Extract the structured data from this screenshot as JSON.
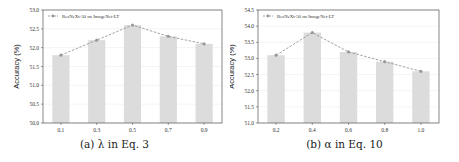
{
  "chart_data": [
    {
      "type": "bar",
      "title": "",
      "caption": "(a) λ in Eq. 3",
      "xlabel": "",
      "ylabel": "Accuracy (%)",
      "categories": [
        "0.1",
        "0.3",
        "0.5",
        "0.7",
        "0.9"
      ],
      "values": [
        51.8,
        52.2,
        52.6,
        52.3,
        52.1
      ],
      "ylim": [
        50.0,
        53.0
      ],
      "yticks": [
        "50.0",
        "50.5",
        "51.0",
        "51.5",
        "52.0",
        "52.5",
        "53.0"
      ],
      "overlay_line": true,
      "legend": {
        "position": "upper left",
        "entries": [
          "ResNeXt-50 on ImageNet-LT"
        ]
      },
      "grid": true
    },
    {
      "type": "bar",
      "title": "",
      "caption": "(b) α in Eq. 10",
      "xlabel": "",
      "ylabel": "Accuracy (%)",
      "categories": [
        "0.2",
        "0.4",
        "0.6",
        "0.8",
        "1.0"
      ],
      "values": [
        53.1,
        53.8,
        53.2,
        52.9,
        52.6
      ],
      "ylim": [
        51.0,
        54.5
      ],
      "yticks": [
        "51.0",
        "51.5",
        "52.0",
        "52.5",
        "53.0",
        "53.5",
        "54.0",
        "54.5"
      ],
      "overlay_line": true,
      "legend": {
        "position": "upper left",
        "entries": [
          "ResNeXt-50 on ImageNet-LT"
        ]
      },
      "grid": true
    }
  ],
  "colors": {
    "bar": "#dcdcdc",
    "line": "#8a8a8a",
    "marker": "#9a9a9a",
    "axis": "#555555",
    "grid": "#ececec"
  }
}
